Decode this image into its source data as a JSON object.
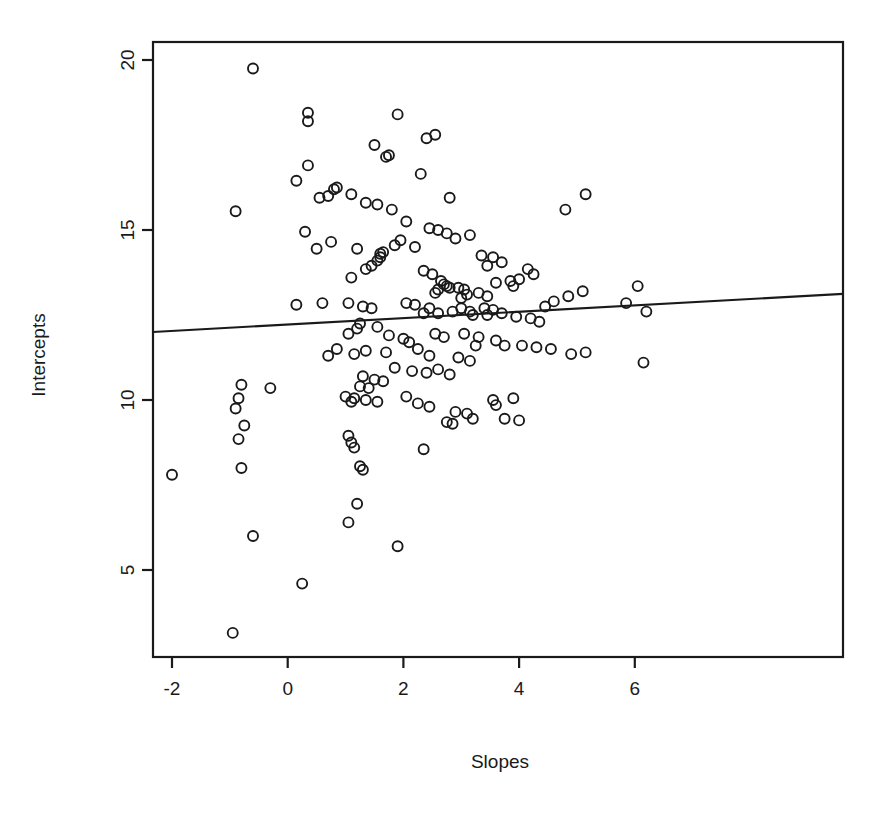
{
  "chart_data": {
    "type": "scatter",
    "title": "",
    "subtitle": "",
    "xlabel": "Slopes",
    "ylabel": "Intercepts",
    "xlim": [
      -2.33,
      6.45
    ],
    "ylim": [
      2.6,
      20.5
    ],
    "xticks": [
      -2,
      0,
      2,
      4,
      6
    ],
    "xtick_labels": [
      "-2",
      "0",
      "2",
      "4",
      "6"
    ],
    "yticks": [
      5,
      10,
      15,
      20
    ],
    "ytick_labels": [
      "5",
      "10",
      "15",
      "20"
    ],
    "grid": false,
    "legend": "none",
    "marker": "open-circle",
    "marker_radius_px": 5,
    "point_color": "#1a1a1a",
    "line_color": "#1a1a1a",
    "box_color": "#1a1a1a",
    "background": "#ffffff",
    "n_points": 176,
    "fit_line": {
      "type": "linear-regression",
      "x_start": -2.33,
      "y_start": 12.0,
      "x_end": 9.6,
      "y_end": 13.12,
      "slope": 0.094,
      "intercept": 12.22
    },
    "points": [
      [
        -0.6,
        19.75
      ],
      [
        0.35,
        18.45
      ],
      [
        0.35,
        18.2
      ],
      [
        1.9,
        18.4
      ],
      [
        2.55,
        17.8
      ],
      [
        2.4,
        17.7
      ],
      [
        1.5,
        17.5
      ],
      [
        1.75,
        17.2
      ],
      [
        1.7,
        17.15
      ],
      [
        0.35,
        16.9
      ],
      [
        0.15,
        16.45
      ],
      [
        0.85,
        16.25
      ],
      [
        0.8,
        16.2
      ],
      [
        1.1,
        16.05
      ],
      [
        0.7,
        16.0
      ],
      [
        0.55,
        15.95
      ],
      [
        2.8,
        15.95
      ],
      [
        2.3,
        16.65
      ],
      [
        5.15,
        16.05
      ],
      [
        4.8,
        15.6
      ],
      [
        1.35,
        15.8
      ],
      [
        1.55,
        15.75
      ],
      [
        1.8,
        15.6
      ],
      [
        -0.9,
        15.55
      ],
      [
        2.05,
        15.25
      ],
      [
        0.3,
        14.95
      ],
      [
        0.75,
        14.65
      ],
      [
        0.5,
        14.45
      ],
      [
        1.2,
        14.45
      ],
      [
        2.45,
        15.05
      ],
      [
        2.6,
        15.0
      ],
      [
        2.75,
        14.9
      ],
      [
        3.15,
        14.85
      ],
      [
        2.9,
        14.75
      ],
      [
        1.95,
        14.7
      ],
      [
        1.85,
        14.55
      ],
      [
        2.2,
        14.5
      ],
      [
        1.65,
        14.35
      ],
      [
        1.6,
        14.3
      ],
      [
        1.6,
        14.2
      ],
      [
        1.55,
        14.1
      ],
      [
        3.35,
        14.25
      ],
      [
        3.55,
        14.2
      ],
      [
        3.7,
        14.05
      ],
      [
        3.45,
        13.95
      ],
      [
        1.45,
        13.95
      ],
      [
        1.35,
        13.85
      ],
      [
        1.1,
        13.6
      ],
      [
        2.35,
        13.8
      ],
      [
        2.5,
        13.7
      ],
      [
        4.15,
        13.85
      ],
      [
        4.25,
        13.7
      ],
      [
        4.0,
        13.55
      ],
      [
        5.1,
        13.2
      ],
      [
        4.85,
        13.05
      ],
      [
        2.65,
        13.5
      ],
      [
        2.7,
        13.4
      ],
      [
        2.75,
        13.35
      ],
      [
        2.8,
        13.3
      ],
      [
        2.6,
        13.25
      ],
      [
        2.55,
        13.15
      ],
      [
        2.95,
        13.3
      ],
      [
        3.05,
        13.25
      ],
      [
        3.1,
        13.1
      ],
      [
        3.0,
        13.0
      ],
      [
        3.3,
        13.15
      ],
      [
        3.45,
        13.05
      ],
      [
        3.6,
        13.45
      ],
      [
        3.85,
        13.5
      ],
      [
        3.9,
        13.35
      ],
      [
        6.05,
        13.35
      ],
      [
        5.85,
        12.85
      ],
      [
        6.2,
        12.6
      ],
      [
        4.6,
        12.9
      ],
      [
        4.45,
        12.75
      ],
      [
        1.05,
        12.85
      ],
      [
        0.6,
        12.85
      ],
      [
        0.15,
        12.8
      ],
      [
        1.3,
        12.75
      ],
      [
        1.45,
        12.7
      ],
      [
        2.05,
        12.85
      ],
      [
        2.2,
        12.8
      ],
      [
        2.45,
        12.7
      ],
      [
        2.35,
        12.55
      ],
      [
        2.6,
        12.55
      ],
      [
        2.85,
        12.6
      ],
      [
        3.0,
        12.7
      ],
      [
        3.15,
        12.6
      ],
      [
        3.2,
        12.5
      ],
      [
        3.4,
        12.7
      ],
      [
        3.55,
        12.65
      ],
      [
        3.45,
        12.5
      ],
      [
        3.7,
        12.55
      ],
      [
        3.95,
        12.45
      ],
      [
        4.2,
        12.4
      ],
      [
        4.35,
        12.3
      ],
      [
        1.25,
        12.25
      ],
      [
        1.2,
        12.1
      ],
      [
        1.05,
        11.95
      ],
      [
        1.55,
        12.15
      ],
      [
        1.75,
        11.9
      ],
      [
        2.0,
        11.8
      ],
      [
        2.1,
        11.7
      ],
      [
        2.55,
        11.95
      ],
      [
        2.7,
        11.85
      ],
      [
        3.05,
        11.95
      ],
      [
        3.3,
        11.85
      ],
      [
        3.25,
        11.6
      ],
      [
        3.6,
        11.75
      ],
      [
        3.75,
        11.6
      ],
      [
        4.05,
        11.6
      ],
      [
        4.3,
        11.55
      ],
      [
        4.55,
        11.5
      ],
      [
        4.9,
        11.35
      ],
      [
        5.15,
        11.4
      ],
      [
        6.15,
        11.1
      ],
      [
        0.85,
        11.5
      ],
      [
        0.7,
        11.3
      ],
      [
        1.15,
        11.35
      ],
      [
        1.35,
        11.45
      ],
      [
        1.7,
        11.4
      ],
      [
        2.25,
        11.5
      ],
      [
        2.45,
        11.3
      ],
      [
        2.95,
        11.25
      ],
      [
        3.15,
        11.15
      ],
      [
        1.85,
        10.95
      ],
      [
        2.15,
        10.85
      ],
      [
        2.4,
        10.8
      ],
      [
        2.6,
        10.9
      ],
      [
        2.8,
        10.75
      ],
      [
        1.3,
        10.7
      ],
      [
        1.5,
        10.6
      ],
      [
        1.65,
        10.55
      ],
      [
        1.25,
        10.4
      ],
      [
        1.4,
        10.35
      ],
      [
        -0.8,
        10.45
      ],
      [
        -0.3,
        10.35
      ],
      [
        -0.85,
        10.05
      ],
      [
        -0.9,
        9.75
      ],
      [
        -0.75,
        9.25
      ],
      [
        -0.85,
        8.85
      ],
      [
        -0.8,
        8.0
      ],
      [
        1.0,
        10.1
      ],
      [
        1.15,
        10.05
      ],
      [
        1.1,
        9.95
      ],
      [
        1.35,
        10.0
      ],
      [
        1.55,
        9.95
      ],
      [
        2.05,
        10.1
      ],
      [
        2.25,
        9.9
      ],
      [
        2.45,
        9.8
      ],
      [
        2.9,
        9.65
      ],
      [
        3.1,
        9.6
      ],
      [
        2.75,
        9.35
      ],
      [
        2.85,
        9.3
      ],
      [
        3.2,
        9.45
      ],
      [
        3.55,
        10.0
      ],
      [
        3.6,
        9.85
      ],
      [
        3.9,
        10.05
      ],
      [
        3.75,
        9.45
      ],
      [
        4.0,
        9.4
      ],
      [
        1.05,
        8.95
      ],
      [
        1.1,
        8.75
      ],
      [
        1.15,
        8.6
      ],
      [
        2.35,
        8.55
      ],
      [
        1.25,
        8.05
      ],
      [
        1.3,
        7.95
      ],
      [
        -2.0,
        7.8
      ],
      [
        1.2,
        6.95
      ],
      [
        1.05,
        6.4
      ],
      [
        -0.6,
        6.0
      ],
      [
        1.9,
        5.7
      ],
      [
        0.25,
        4.6
      ],
      [
        -0.95,
        3.15
      ]
    ]
  },
  "axis": {
    "x_title": "Slopes",
    "y_title": "Intercepts"
  },
  "geometry": {
    "plot_left": 153,
    "plot_right": 843,
    "plot_top": 42,
    "plot_bottom": 657,
    "x0_px": 287.7,
    "x_unit_px": 57.85,
    "y10_px": 400,
    "y_unit_px": 34
  }
}
